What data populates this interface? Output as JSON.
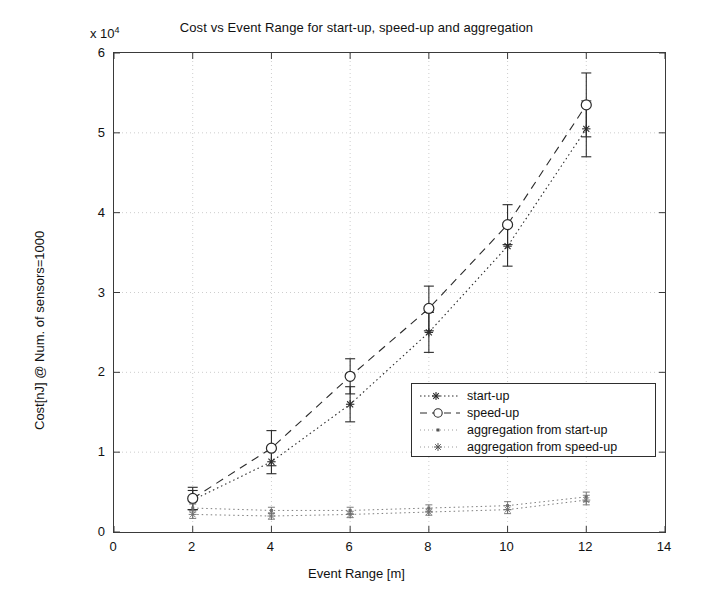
{
  "chart_data": {
    "type": "line",
    "title": "Cost vs Event Range for start-up, speed-up and aggregation",
    "xlabel": "Event Range [m]",
    "ylabel": "Cost[nJ] @ Num. of sensors=1000",
    "y_multiplier": "x 10",
    "y_multiplier_exp": "4",
    "xlim": [
      0,
      14
    ],
    "ylim": [
      0,
      6
    ],
    "xticks": [
      0,
      2,
      4,
      6,
      8,
      10,
      12,
      14
    ],
    "yticks": [
      0,
      1,
      2,
      3,
      4,
      5,
      6
    ],
    "grid": true,
    "legend_position": "center-right",
    "x": [
      2,
      4,
      6,
      8,
      10,
      12
    ],
    "series": [
      {
        "name": "start-up",
        "marker": "star",
        "linestyle": "dotted",
        "values": [
          0.4,
          0.88,
          1.6,
          2.5,
          3.58,
          5.05
        ],
        "errors": [
          0.12,
          0.15,
          0.22,
          0.25,
          0.25,
          0.35
        ]
      },
      {
        "name": "speed-up",
        "marker": "circle",
        "linestyle": "dashed",
        "values": [
          0.42,
          1.05,
          1.95,
          2.8,
          3.85,
          5.35
        ],
        "errors": [
          0.14,
          0.22,
          0.22,
          0.28,
          0.25,
          0.4
        ]
      },
      {
        "name": "aggregation from start-up",
        "marker": "dot",
        "linestyle": "dotted",
        "values": [
          0.3,
          0.27,
          0.27,
          0.3,
          0.33,
          0.44
        ],
        "errors": [
          0.05,
          0.04,
          0.04,
          0.04,
          0.05,
          0.06
        ]
      },
      {
        "name": "aggregation from speed-up",
        "marker": "asterisk",
        "linestyle": "dotted",
        "values": [
          0.22,
          0.2,
          0.22,
          0.25,
          0.28,
          0.4
        ],
        "errors": [
          0.05,
          0.04,
          0.04,
          0.04,
          0.05,
          0.06
        ]
      }
    ]
  },
  "axis": {
    "x_tick_labels": [
      "0",
      "2",
      "4",
      "6",
      "8",
      "10",
      "12",
      "14"
    ],
    "y_tick_labels": [
      "0",
      "1",
      "2",
      "3",
      "4",
      "5",
      "6"
    ]
  },
  "legend": {
    "items": [
      {
        "label": "start-up"
      },
      {
        "label": "speed-up"
      },
      {
        "label": "aggregation from start-up"
      },
      {
        "label": "aggregation from speed-up"
      }
    ]
  },
  "colors": {
    "axis": "#3a3a3a",
    "grid": "#c8c8c8",
    "series": "#2a2a2a",
    "background": "#ffffff"
  }
}
